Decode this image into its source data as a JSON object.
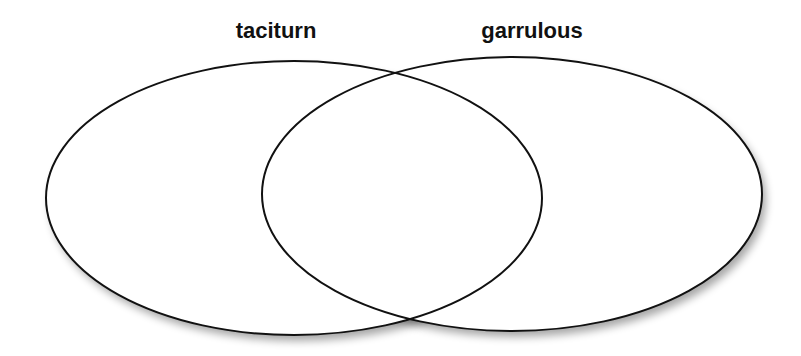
{
  "diagram": {
    "type": "venn",
    "sets": [
      {
        "label": "taciturn",
        "ellipse": {
          "cx": 294,
          "cy": 198,
          "rx": 248,
          "ry": 137
        },
        "label_pos": {
          "x": 276,
          "y": 38
        }
      },
      {
        "label": "garrulous",
        "ellipse": {
          "cx": 512,
          "cy": 194,
          "rx": 250,
          "ry": 137
        },
        "label_pos": {
          "x": 532,
          "y": 38
        }
      }
    ],
    "colors": {
      "stroke": "#111111",
      "fill": "#ffffff",
      "shadow": "#8a8a8a",
      "background": "#ffffff"
    }
  }
}
